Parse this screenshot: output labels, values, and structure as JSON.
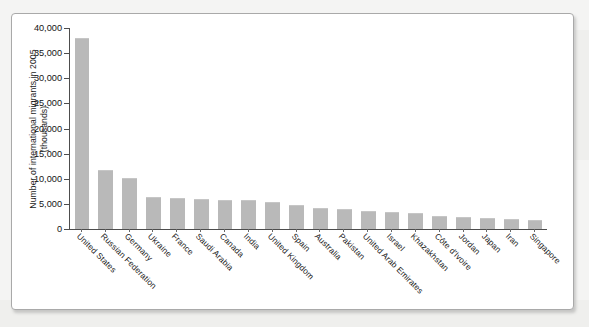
{
  "figure": {
    "frame_border_color": "#a9a9a9",
    "background_color": "#ffffff",
    "page_background_color": "#f4f4f3"
  },
  "chart_data": {
    "type": "bar",
    "title": "",
    "subtitle": "",
    "xlabel": "",
    "ylabel": "Number of international migrants in 2005 (thousands)",
    "ylim": [
      0,
      40000
    ],
    "ytick_labels": [
      "0",
      "5,000",
      "10,000",
      "15,000",
      "20,000",
      "25,000",
      "30,000",
      "35,000",
      "40,000"
    ],
    "ytick_values": [
      0,
      5000,
      10000,
      15000,
      20000,
      25000,
      30000,
      35000,
      40000
    ],
    "grid": false,
    "legend": false,
    "legend_position": "none",
    "bar_color": "#b9b9b9",
    "axis_color": "#4d4d4d",
    "categories": [
      "United States",
      "Russian Federation",
      "Germany",
      "Ukraine",
      "France",
      "Saudi Arabia",
      "Canada",
      "India",
      "United Kingdom",
      "Spain",
      "Australia",
      "Pakistan",
      "United Arab Emirates",
      "Israel",
      "Khazakhstan",
      "Côte d'Ivoire",
      "Jordan",
      "Japan",
      "Iran",
      "Singapore"
    ],
    "values": [
      38000,
      11700,
      10100,
      6400,
      6100,
      5900,
      5800,
      5800,
      5400,
      4800,
      4100,
      3900,
      3600,
      3400,
      3100,
      2600,
      2400,
      2100,
      1900,
      1800
    ]
  }
}
